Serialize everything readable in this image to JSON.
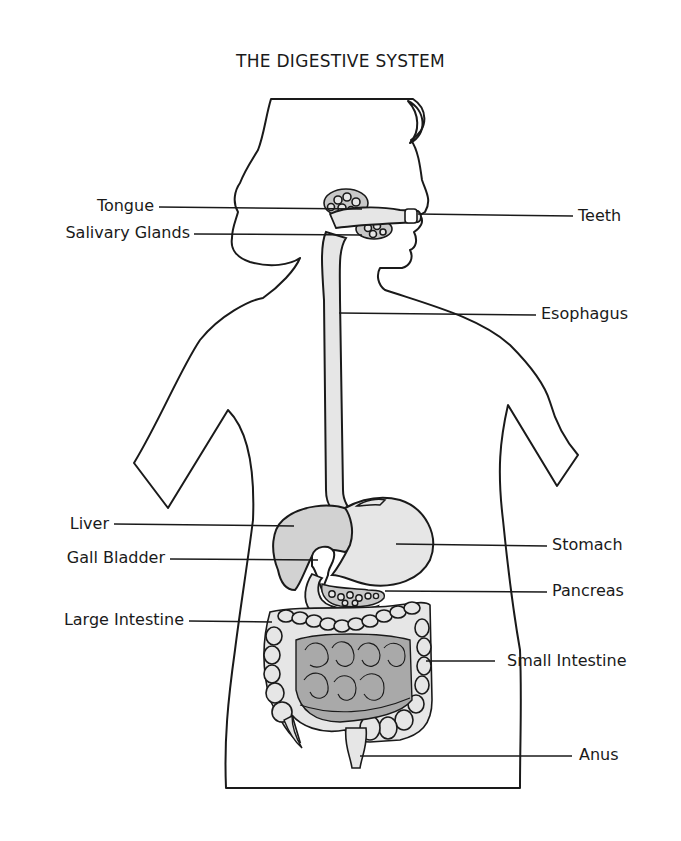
{
  "title": "THE DIGESTIVE SYSTEM",
  "colors": {
    "ink": "#1a1a1a",
    "organ_fill": "#e6e6e6",
    "gland_fill": "#c8c8c8",
    "small_intestine_fill": "#a9a9a9",
    "background": "#ffffff"
  },
  "labels": {
    "left": [
      {
        "id": "tongue",
        "text": "Tongue"
      },
      {
        "id": "salivary_glands",
        "text": "Salivary Glands"
      },
      {
        "id": "liver",
        "text": "Liver"
      },
      {
        "id": "gall_bladder",
        "text": "Gall Bladder"
      },
      {
        "id": "large_intestine",
        "text": "Large Intestine"
      }
    ],
    "right": [
      {
        "id": "teeth",
        "text": "Teeth"
      },
      {
        "id": "esophagus",
        "text": "Esophagus"
      },
      {
        "id": "stomach",
        "text": "Stomach"
      },
      {
        "id": "pancreas",
        "text": "Pancreas"
      },
      {
        "id": "small_intestine",
        "text": "Small Intestine"
      },
      {
        "id": "anus",
        "text": "Anus"
      }
    ]
  }
}
